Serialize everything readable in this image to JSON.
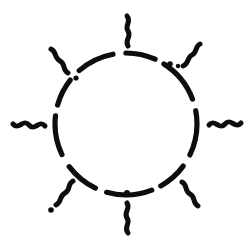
{
  "artwork": {
    "title": "Sun Symbol",
    "subject": "sun",
    "style": "hand-drawn ink sketch",
    "background_color": "#ffffff",
    "ink_color": "#0d0d0d",
    "canvas": {
      "width": 250,
      "height": 250
    }
  },
  "sun": {
    "core": {
      "name": "dashed-circle",
      "center_x": 126,
      "center_y": 124,
      "radius": 71,
      "stroke_width": 5.2,
      "dash_pattern": "38 13 30 10 46 12 34 14 40 11 28 13",
      "dash_offset": 6,
      "description": "broken hand-inked circular outline"
    },
    "junction_dots": [
      {
        "name": "dot-upper-left",
        "cx": 76,
        "cy": 78,
        "r": 2.6
      },
      {
        "name": "dot-upper-right",
        "cx": 170,
        "cy": 64,
        "r": 2.8
      },
      {
        "name": "dot-upper-right-inner",
        "cx": 178,
        "cy": 66,
        "r": 2.2
      },
      {
        "name": "dot-bottom",
        "cx": 127,
        "cy": 193,
        "r": 3.0
      },
      {
        "name": "dot-bottom-left-tip",
        "cx": 51,
        "cy": 210,
        "r": 2.8
      },
      {
        "name": "dot-left-edge",
        "cx": 55,
        "cy": 128,
        "r": 2.4
      }
    ],
    "rays": [
      {
        "name": "ray-north",
        "angle_deg": 270,
        "shape": "vertical-zigzag",
        "stroke_width": 5.0,
        "path": "M 128 46 C 124 40 132 37 128 31 C 124 25 132 22 127 16"
      },
      {
        "name": "ray-northeast",
        "angle_deg": 315,
        "shape": "diagonal-zigzag",
        "stroke_width": 5.0,
        "path": "M 183 66 C 189 64 187 57 192 55 C 197 53 195 46 200 44"
      },
      {
        "name": "ray-east",
        "angle_deg": 0,
        "shape": "horizontal-squiggle",
        "stroke_width": 5.0,
        "path": "M 209 125 C 215 118 219 131 225 124 C 231 117 235 130 241 123"
      },
      {
        "name": "ray-southeast",
        "angle_deg": 45,
        "shape": "diagonal-zigzag",
        "stroke_width": 5.0,
        "path": "M 182 182 C 188 185 184 191 190 194 C 196 197 192 203 198 206"
      },
      {
        "name": "ray-south",
        "angle_deg": 90,
        "shape": "vertical-zigzag",
        "stroke_width": 5.0,
        "path": "M 127 203 C 131 209 123 212 127 218 C 131 224 123 227 128 233"
      },
      {
        "name": "ray-southwest",
        "angle_deg": 135,
        "shape": "diagonal-zigzag",
        "stroke_width": 5.0,
        "path": "M 73 181 C 67 184 71 190 65 193 C 59 196 62 202 56 205"
      },
      {
        "name": "ray-west",
        "angle_deg": 180,
        "shape": "horizontal-squiggle",
        "stroke_width": 5.0,
        "path": "M 45 126 C 39 119 35 132 29 125 C 23 118 19 131 13 124"
      },
      {
        "name": "ray-northwest",
        "angle_deg": 225,
        "shape": "diagonal-zigzag",
        "stroke_width": 5.0,
        "path": "M 68 73 C 62 70 66 64 60 61 C 54 58 57 52 51 49"
      }
    ]
  }
}
